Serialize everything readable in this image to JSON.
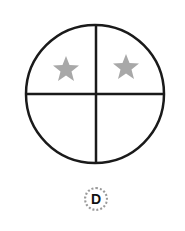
{
  "figure": {
    "option_label": "D",
    "circle": {
      "quadrants": 4,
      "stroke_color": "#1a1a1a"
    },
    "stars": [
      {
        "quadrant": "top-left",
        "color": "#a8a8a8"
      },
      {
        "quadrant": "top-right",
        "color": "#a8a8a8"
      }
    ]
  }
}
